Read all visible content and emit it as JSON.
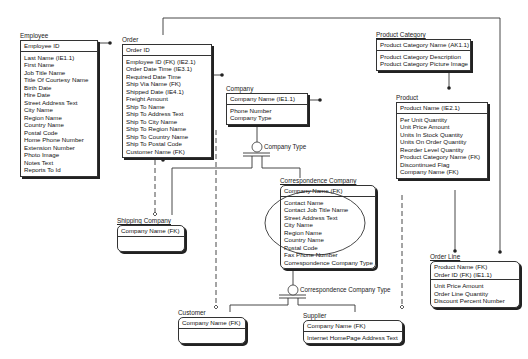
{
  "entities": {
    "employee": {
      "name": "Employee",
      "keys": [
        "Employee ID"
      ],
      "attrs": [
        "Last Name (IE1.1)",
        "First Name",
        "Job Title Name",
        "Title Of Courtesy Name",
        "Birth Date",
        "Hire Date",
        "Street Address Text",
        "City Name",
        "Region Name",
        "Country Name",
        "Postal Code",
        "Home Phone Number",
        "Extension Number",
        "Photo Image",
        "Notes Text",
        "Reports To Id"
      ]
    },
    "order": {
      "name": "Order",
      "keys": [
        "Order ID"
      ],
      "attrs": [
        "Employee ID (FK) (IE2.1)",
        "Order Date Time (IE3.1)",
        "Required Date Time",
        "Ship Via Name (FK)",
        "Shipped Date (IE4.1)",
        "Freight Amount",
        "Ship To Name",
        "Ship To Address Text",
        "Ship To City Name",
        "Ship To Region Name",
        "Ship To Country Name",
        "Ship To Postal Code",
        "Customer Name (FK)"
      ]
    },
    "company": {
      "name": "Company",
      "keys": [
        "Company Name (IE1.1)"
      ],
      "attrs": [
        "Phone Number",
        "Company Type"
      ]
    },
    "product_category": {
      "name": "Product Category",
      "keys": [
        "Product Category Name (AK1.1)"
      ],
      "attrs": [
        "Product Category Description",
        "Product Category Picture Image"
      ]
    },
    "product": {
      "name": "Product",
      "keys": [
        "Product Name (IE2.1)"
      ],
      "attrs": [
        "Per Unit Quantity",
        "Unit Price Amount",
        "Units In Stock Quantity",
        "Units On Order Quantity",
        "Reorder Level Quantity",
        "Product Category Name (FK)",
        "Discontinued Flag",
        "Company Name (FK)"
      ]
    },
    "correspondence_company": {
      "name": "Correspondence Company",
      "keys": [
        "Company Name (FK)"
      ],
      "attrs": [
        "Contact Name",
        "Contact Job Title Name",
        "Street Address Text",
        "City Name",
        "Region Name",
        "Country Name",
        "Postal Code",
        "Fax Phone Number",
        "Correspondence Company Type"
      ]
    },
    "shipping_company": {
      "name": "Shipping Company",
      "keys": [
        "Company Name (FK)"
      ],
      "attrs": []
    },
    "customer": {
      "name": "Customer",
      "keys": [
        "Company Name (FK)"
      ],
      "attrs": []
    },
    "supplier": {
      "name": "Supplier",
      "keys": [
        "Company Name (FK)"
      ],
      "attrs": [
        "Internet HomePage Address Text"
      ]
    },
    "order_line": {
      "name": "Order Line",
      "keys": [
        "Product Name (FK)",
        "Order ID (FK) (IE1.1)"
      ],
      "attrs": [
        "Unit Price Amount",
        "Order Line Quantity",
        "Discount Percent Number"
      ]
    }
  },
  "relationship_labels": {
    "company_type": "Company Type",
    "correspondence_company_type": "Correspondence Company Type"
  }
}
